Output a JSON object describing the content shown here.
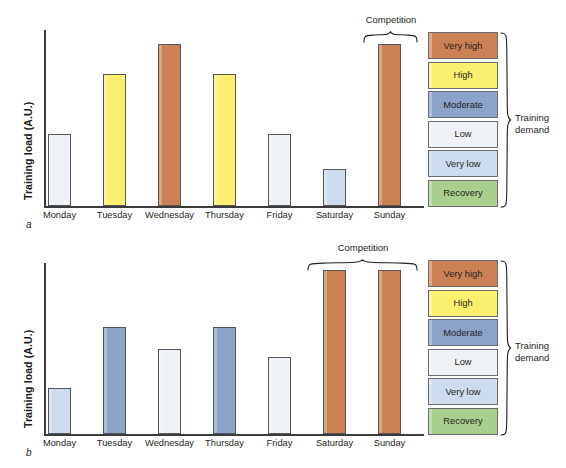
{
  "figure": {
    "y_axis_label": "Training load (A.U.)",
    "competition_label": "Competition",
    "legend_title_line1": "Training",
    "legend_title_line2": "demand",
    "panel_a_letter": "a",
    "panel_b_letter": "b"
  },
  "legend": {
    "items": [
      {
        "label": "Very high",
        "color": "#cc8154"
      },
      {
        "label": "High",
        "color": "#fbef70"
      },
      {
        "label": "Moderate",
        "color": "#8ba2c9"
      },
      {
        "label": "Low",
        "color": "#eef2f6"
      },
      {
        "label": "Very low",
        "color": "#ccdcee"
      },
      {
        "label": "Recovery",
        "color": "#a9cf8e"
      }
    ]
  },
  "chart_data": [
    {
      "type": "bar",
      "panel": "a",
      "title": "",
      "xlabel": "",
      "ylabel": "Training load (A.U.)",
      "ylim": [
        0,
        180
      ],
      "grid": false,
      "legend_position": "right",
      "categories": [
        "Monday",
        "Tuesday",
        "Wednesday",
        "Thursday",
        "Friday",
        "Saturday",
        "Sunday"
      ],
      "values": [
        72,
        132,
        162,
        132,
        72,
        37,
        162
      ],
      "demand_levels": [
        "Low",
        "High",
        "Very high",
        "High",
        "Low",
        "Very low",
        "Very high"
      ],
      "colors": [
        "#eef2f6",
        "#fbef70",
        "#cc8154",
        "#fbef70",
        "#eef2f6",
        "#ccdcee",
        "#cc8154"
      ],
      "annotations": [
        {
          "text": "Competition",
          "spans": [
            "Sunday"
          ]
        }
      ]
    },
    {
      "type": "bar",
      "panel": "b",
      "title": "",
      "xlabel": "",
      "ylabel": "Training load (A.U.)",
      "ylim": [
        0,
        180
      ],
      "grid": false,
      "legend_position": "right",
      "categories": [
        "Monday",
        "Tuesday",
        "Wednesday",
        "Thursday",
        "Friday",
        "Saturday",
        "Sunday"
      ],
      "values": [
        46,
        107,
        85,
        107,
        77,
        164,
        164
      ],
      "demand_levels": [
        "Very low",
        "Moderate",
        "Low",
        "Moderate",
        "Low",
        "Very high",
        "Very high"
      ],
      "colors": [
        "#ccdcee",
        "#8ba2c9",
        "#eef2f6",
        "#8ba2c9",
        "#eef2f6",
        "#cc8154",
        "#cc8154"
      ],
      "annotations": [
        {
          "text": "Competition",
          "spans": [
            "Saturday",
            "Sunday"
          ]
        }
      ]
    }
  ]
}
